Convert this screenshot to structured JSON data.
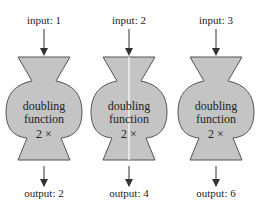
{
  "machines": [
    {
      "input_label": "input: 1",
      "name_line1": "doubling",
      "name_line2": "function",
      "rule": "2 ×",
      "output_label": "output: 2",
      "split": false
    },
    {
      "input_label": "input: 2",
      "name_line1": "doubling",
      "name_line2": "function",
      "rule": "2 ×",
      "output_label": "output: 4",
      "split": true
    },
    {
      "input_label": "input: 3",
      "name_line1": "doubling",
      "name_line2": "function",
      "rule": "2 ×",
      "output_label": "output: 6",
      "split": false
    }
  ],
  "colors": {
    "fill": "#c4c4c4",
    "stroke": "#555555",
    "arrow": "#333333"
  }
}
